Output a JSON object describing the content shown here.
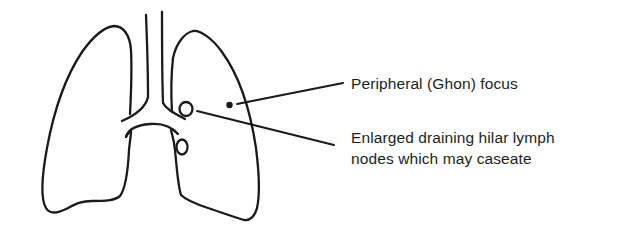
{
  "figure": {
    "structures": [
      {
        "name": "left-lung",
        "icon": "lung-outline"
      },
      {
        "name": "right-lung",
        "icon": "lung-outline"
      },
      {
        "name": "trachea",
        "icon": "tube-outline"
      },
      {
        "name": "main-bronchi",
        "icon": "branch-outline"
      },
      {
        "name": "ghon-focus",
        "icon": "filled-dot"
      },
      {
        "name": "hilar-lymph-node-upper",
        "icon": "small-circle"
      },
      {
        "name": "hilar-lymph-node-lower",
        "icon": "small-circle"
      }
    ],
    "colors": {
      "ink": "#1a1a1a",
      "text": "#1e1e1e",
      "background": "#ffffff"
    }
  },
  "annotations": {
    "ghon": {
      "text": "Peripheral (Ghon) focus"
    },
    "hilar": {
      "line1": "Enlarged draining hilar lymph",
      "line2": "nodes which may caseate"
    }
  }
}
